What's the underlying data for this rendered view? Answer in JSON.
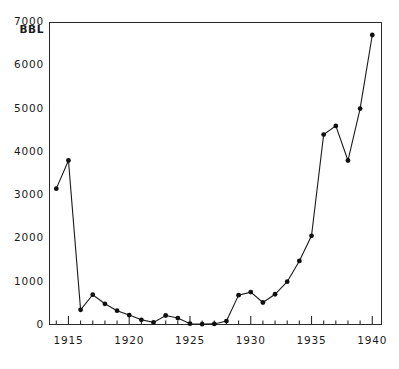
{
  "chart_data": {
    "type": "line",
    "title": "",
    "xlabel": "",
    "ylabel": "BBL",
    "y_unit_caption": "BBL",
    "xlim": [
      1913.4,
      1940.8
    ],
    "ylim": [
      0,
      7000
    ],
    "grid": false,
    "legend": "none",
    "markers": "filled-circle",
    "x_tick_labels": [
      "1915",
      "1920",
      "1925",
      "1930",
      "1935",
      "1940"
    ],
    "x_tick_values": [
      1915,
      1920,
      1925,
      1930,
      1935,
      1940
    ],
    "x_minor_tick_interval": 1,
    "y_tick_labels": [
      "7000",
      "6000",
      "5000",
      "4000",
      "3000",
      "2000",
      "1000",
      "0"
    ],
    "y_tick_values": [
      7000,
      6000,
      5000,
      4000,
      3000,
      2000,
      1000,
      0
    ],
    "x": [
      1914,
      1915,
      1916,
      1917,
      1918,
      1919,
      1920,
      1921,
      1922,
      1923,
      1924,
      1925,
      1926,
      1927,
      1928,
      1929,
      1930,
      1931,
      1932,
      1933,
      1934,
      1935,
      1936,
      1937,
      1938,
      1939,
      1940
    ],
    "values": [
      3150,
      3800,
      350,
      700,
      490,
      330,
      230,
      120,
      60,
      220,
      160,
      30,
      20,
      25,
      90,
      690,
      760,
      520,
      710,
      1000,
      1480,
      2060,
      4400,
      4600,
      3800,
      5000,
      6700
    ],
    "series": [
      {
        "name": "BBL",
        "color": "#1a1a1a",
        "x": [
          1914,
          1915,
          1916,
          1917,
          1918,
          1919,
          1920,
          1921,
          1922,
          1923,
          1924,
          1925,
          1926,
          1927,
          1928,
          1929,
          1930,
          1931,
          1932,
          1933,
          1934,
          1935,
          1936,
          1937,
          1938,
          1939,
          1940
        ],
        "values": [
          3150,
          3800,
          350,
          700,
          490,
          330,
          230,
          120,
          60,
          220,
          160,
          30,
          20,
          25,
          90,
          690,
          760,
          520,
          710,
          1000,
          1480,
          2060,
          4400,
          4600,
          3800,
          5000,
          6700
        ]
      }
    ]
  },
  "colors": {
    "line": "#1a1a1a",
    "marker": "#101010",
    "frame": "#2a2a2a",
    "background": "#ffffff"
  }
}
